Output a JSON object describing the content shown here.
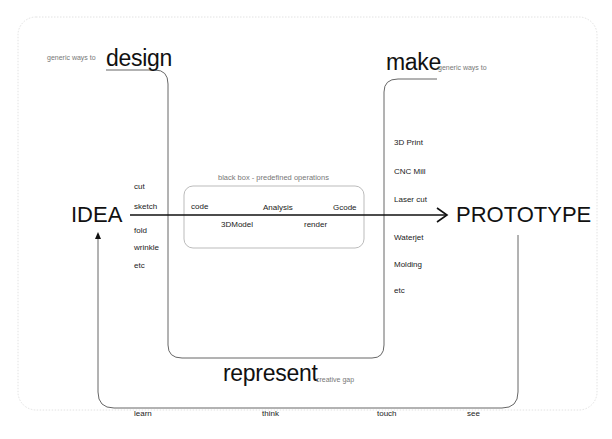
{
  "diagram": {
    "top_left": {
      "prefix": "generic ways to",
      "title": "design"
    },
    "top_right": {
      "title": "make",
      "suffix": "generic ways to"
    },
    "bottom": {
      "title": "represent",
      "suffix": "creative gap"
    },
    "left_node": "IDEA",
    "right_node": "PROTOTYPE",
    "design_methods": [
      "cut",
      "sketch",
      "fold",
      "wrinkle",
      "etc"
    ],
    "black_box": {
      "title": "black box - predefined operations",
      "operations": [
        "code",
        "Analysis",
        "Gcode",
        "3DModel",
        "render"
      ]
    },
    "make_methods": [
      "3D Print",
      "CNC Mill",
      "Laser cut",
      "Waterjet",
      "Molding",
      "etc"
    ],
    "feedback_loop": [
      "learn",
      "think",
      "touch",
      "see"
    ],
    "colors": {
      "line": "#555555",
      "arrow": "#111111",
      "frame": "#e4e4e4",
      "box": "#aaaaaa"
    }
  }
}
